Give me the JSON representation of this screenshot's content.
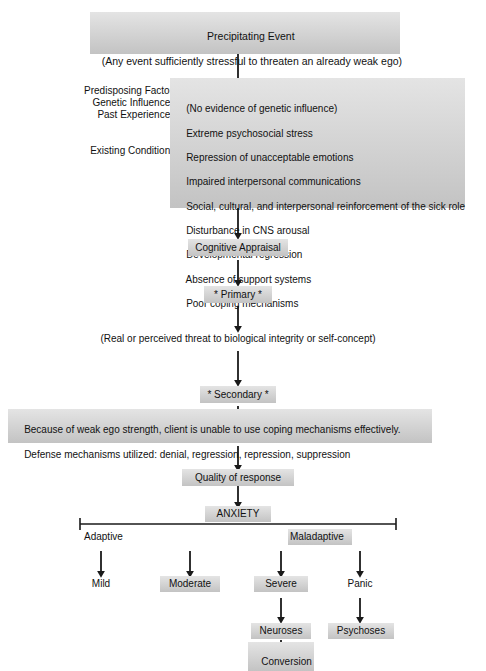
{
  "figure": {
    "box_fill_top": "#e4e4e4",
    "box_fill_bottom": "#c3c3c3",
    "line_color": "#1a1a1a",
    "text_color": "#111111"
  },
  "nodes": {
    "precipitating_event": {
      "line1": "Precipitating Event",
      "line2": "(Any event sufficiently stressful to threaten an already weak ego)"
    },
    "predisposing_labels": {
      "heading": "Predisposing Factors",
      "genetic": "Genetic Influences:",
      "past": "Past Experiences:",
      "existing": "Existing Conditions:"
    },
    "predisposing_factors": [
      "(No evidence of genetic influence)",
      "Extreme psychosocial stress",
      "Repression of unacceptable emotions",
      "Impaired interpersonal communications",
      "Social, cultural, and interpersonal reinforcement of the sick role",
      "Disturbance in CNS arousal",
      "Developmental regression",
      "Absence of support systems",
      "Poor coping mechanisms"
    ],
    "cognitive_appraisal": "Cognitive Appraisal",
    "primary": "* Primary *",
    "threat": "(Real or perceived threat to biological integrity or self-concept)",
    "secondary": "* Secondary *",
    "ego_strength": {
      "line1": "Because of weak ego strength, client is unable to use coping mechanisms effectively.",
      "line2": "Defense mechanisms utilized: denial, regression, repression, suppression"
    },
    "quality_of_response": "Quality of response",
    "anxiety": "ANXIETY",
    "adaptive": "Adaptive",
    "maladaptive": "Maladaptive",
    "mild": "Mild",
    "moderate": "Moderate",
    "severe": "Severe",
    "panic": "Panic",
    "neuroses": "Neuroses",
    "psychoses": "Psychoses",
    "conversion_disorder": {
      "line1": "Conversion",
      "line2": "Disorder"
    }
  }
}
